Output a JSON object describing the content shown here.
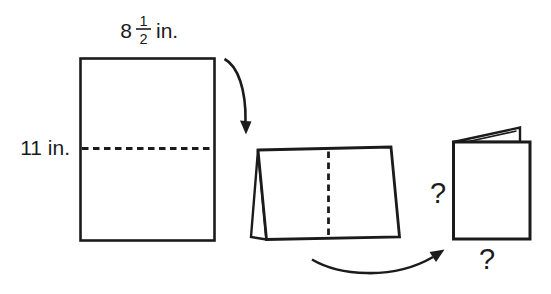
{
  "colors": {
    "ink": "#1b1b1b",
    "background": "#ffffff"
  },
  "figure": {
    "sheet": {
      "width_whole": "8",
      "width_fraction_numerator": "1",
      "width_fraction_denominator": "2",
      "width_unit": "in.",
      "height_label": "11 in."
    },
    "folded_card": {
      "unknown_height": "?",
      "unknown_width": "?"
    }
  }
}
